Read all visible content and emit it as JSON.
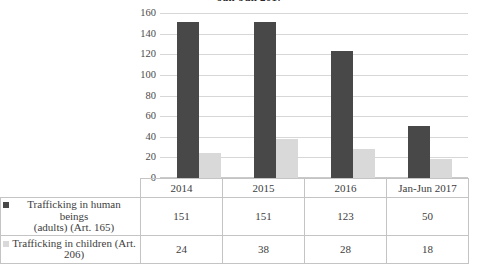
{
  "chart_data": {
    "type": "bar",
    "title": "Jan-Jun 2017",
    "xlabel": "",
    "ylabel": "",
    "ylim": [
      0,
      160
    ],
    "yticks": [
      0,
      20,
      40,
      60,
      80,
      100,
      120,
      140,
      160
    ],
    "grid": true,
    "legend_position": "table-left",
    "categories": [
      "2014",
      "2015",
      "2016",
      "Jan-Jun 2017"
    ],
    "series": [
      {
        "name": "Trafficking in human beings (adults) (Art. 165)",
        "color": "#484848",
        "values": [
          151,
          151,
          123,
          50
        ]
      },
      {
        "name": "Trafficking in children (Art. 206)",
        "color": "#d9d9d9",
        "values": [
          24,
          38,
          28,
          18
        ]
      }
    ]
  },
  "yaxis": {
    "labels": [
      "160",
      "140",
      "120",
      "100",
      "80",
      "60",
      "40",
      "20",
      "0"
    ]
  },
  "table": {
    "header": [
      "2014",
      "2015",
      "2016",
      "Jan-Jun 2017"
    ],
    "rows": [
      {
        "label_line1": "Trafficking in human beings",
        "label_line2": "(adults) (Art. 165)",
        "values": [
          "151",
          "151",
          "123",
          "50"
        ]
      },
      {
        "label_line1": "Trafficking in children (Art.",
        "label_line2": "206)",
        "values": [
          "24",
          "38",
          "28",
          "18"
        ]
      }
    ]
  },
  "colors": {
    "series_adults": "#484848",
    "series_children": "#d9d9d9",
    "gridline": "#d7d7d7",
    "border": "#c4c4c4"
  }
}
